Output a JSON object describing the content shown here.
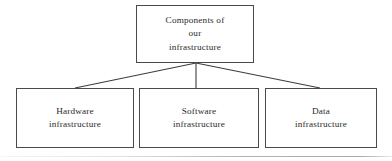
{
  "diagram": {
    "type": "hierarchy-tree",
    "background_color": "#ffffff",
    "border_color": "#4a4a4a",
    "text_color": "#2b2b2b",
    "connector_color": "#3d3d3d",
    "root": {
      "id": "root",
      "label": "Components of\nour\ninfrastructure",
      "lines": [
        "Components of",
        "our",
        "infrastructure"
      ]
    },
    "children": [
      {
        "id": "hardware",
        "label": "Hardware\ninfrastructure",
        "lines": [
          "Hardware",
          "infrastructure"
        ]
      },
      {
        "id": "software",
        "label": "Software\ninfrastructure",
        "lines": [
          "Software",
          "infrastructure"
        ]
      },
      {
        "id": "data",
        "label": "Data\ninfrastructure",
        "lines": [
          "Data",
          "infrastructure"
        ]
      }
    ],
    "connectors": {
      "apex_x": 196,
      "apex_y": 63,
      "endpoints": [
        {
          "to": "hardware",
          "x": 75,
          "y": 88
        },
        {
          "to": "software",
          "x": 196,
          "y": 88
        },
        {
          "to": "data",
          "x": 320,
          "y": 88
        }
      ]
    },
    "footer_rule": {
      "color": "#8a8a92",
      "y": 156
    }
  }
}
